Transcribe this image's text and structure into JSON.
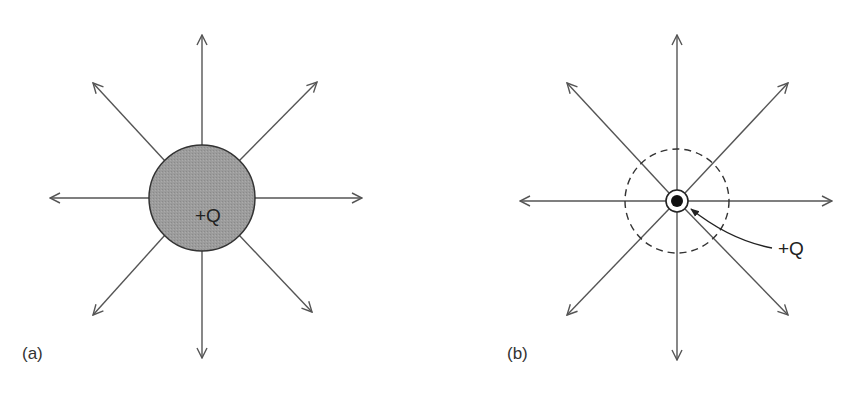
{
  "panels": [
    {
      "id": "a",
      "label": "(a)",
      "charge_label": "+Q",
      "description": "Charged sphere with radial field lines",
      "colors": {
        "sphere_fill": "#9a9a9a",
        "line": "#555555"
      }
    },
    {
      "id": "b",
      "label": "(b)",
      "charge_label": "+Q",
      "description": "Point charge with radial field lines and dashed Gaussian circle",
      "colors": {
        "dot": "#111111",
        "line": "#555555",
        "dashed": "#333333"
      }
    }
  ]
}
